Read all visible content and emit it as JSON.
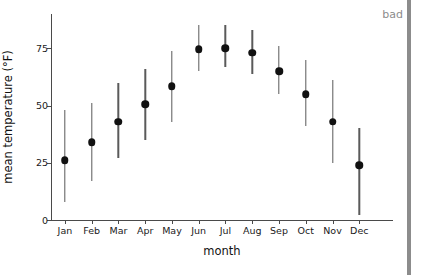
{
  "annotation": {
    "label": "bad",
    "color": "#8c8c8c"
  },
  "chart_data": {
    "type": "scatter",
    "title": "",
    "xlabel": "month",
    "ylabel": "mean temperature (°F)",
    "categories": [
      "Jan",
      "Feb",
      "Mar",
      "Apr",
      "May",
      "Jun",
      "Jul",
      "Aug",
      "Sep",
      "Oct",
      "Nov",
      "Dec"
    ],
    "values": [
      26,
      34,
      43,
      50.5,
      58.5,
      74.5,
      75,
      73,
      65,
      55,
      43,
      24
    ],
    "error_low": [
      8,
      17,
      27,
      35,
      43,
      65,
      67,
      64,
      55,
      41,
      25,
      2
    ],
    "error_high": [
      48,
      51,
      60,
      66,
      74,
      85,
      85,
      83,
      76,
      70,
      61,
      40
    ],
    "ylim": [
      0,
      90
    ],
    "yticks": [
      0,
      25,
      50,
      75
    ],
    "ytick_labels": [
      "0",
      "25",
      "50",
      "75"
    ],
    "grid": false,
    "legend": "none",
    "marker": "filled-circle",
    "marker_color": "#111111",
    "errorbar_color": "#5a5a5a"
  }
}
